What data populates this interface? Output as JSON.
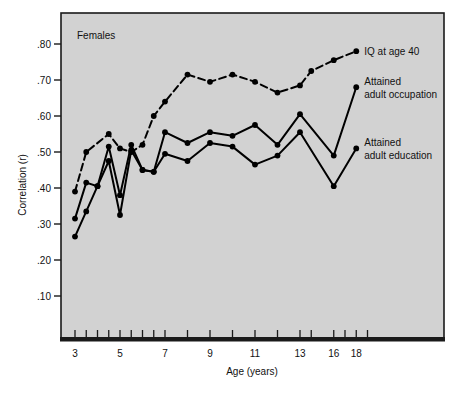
{
  "figure": {
    "panel_label": "Females",
    "background_color": "#d2d2d2",
    "frame_color": "#1a1a1a",
    "line_color": "#000000"
  },
  "chart_data": {
    "type": "line",
    "title": "Females",
    "xlabel": "Age (years)",
    "ylabel": "Correlation (r)",
    "xlim": [
      2.5,
      19.5
    ],
    "ylim": [
      0.0,
      0.86
    ],
    "grid": false,
    "legend_position": "right-inline-labels",
    "x_tick_labels": [
      "3",
      "5",
      "7",
      "9",
      "11",
      "13",
      "16",
      "18"
    ],
    "x_tick_values": [
      3,
      5,
      7,
      9,
      11,
      13,
      16,
      18
    ],
    "x_minor_tick_values": [
      3.5,
      4,
      4.5,
      5.5,
      6,
      6.5,
      8,
      10,
      12,
      14,
      17,
      19
    ],
    "y_tick_labels": [
      ".80",
      ".70",
      ".60",
      ".50",
      ".40",
      ".30",
      ".20",
      ".10"
    ],
    "y_tick_values": [
      0.8,
      0.7,
      0.6,
      0.5,
      0.4,
      0.3,
      0.2,
      0.1
    ],
    "series": [
      {
        "name": "IQ at age 40",
        "label": "IQ at age 40",
        "style": "dashed",
        "x": [
          3,
          3.5,
          4.5,
          5,
          5.5,
          6,
          6.5,
          7,
          8,
          9,
          10,
          11,
          12,
          13,
          14,
          16,
          18
        ],
        "values": [
          0.39,
          0.5,
          0.55,
          0.51,
          0.5,
          0.52,
          0.6,
          0.64,
          0.715,
          0.695,
          0.715,
          0.695,
          0.665,
          0.685,
          0.725,
          0.755,
          0.78
        ]
      },
      {
        "name": "Attained adult occupation",
        "label": "Attained adult occupation",
        "style": "solid",
        "x": [
          3,
          3.5,
          4,
          4.5,
          5,
          5.5,
          6,
          6.5,
          7,
          8,
          9,
          10,
          11,
          12,
          13,
          16,
          18
        ],
        "values": [
          0.315,
          0.415,
          0.405,
          0.515,
          0.38,
          0.52,
          0.45,
          0.445,
          0.555,
          0.525,
          0.555,
          0.545,
          0.575,
          0.52,
          0.605,
          0.49,
          0.68
        ]
      },
      {
        "name": "Attained adult education",
        "label": "Attained adult education",
        "style": "solid",
        "x": [
          3,
          3.5,
          4,
          4.5,
          5,
          5.5,
          6,
          6.5,
          7,
          8,
          9,
          10,
          11,
          12,
          13,
          16,
          18
        ],
        "values": [
          0.265,
          0.335,
          0.405,
          0.475,
          0.325,
          0.505,
          0.45,
          0.445,
          0.495,
          0.475,
          0.525,
          0.515,
          0.465,
          0.49,
          0.555,
          0.405,
          0.51
        ]
      }
    ]
  },
  "annotations": {
    "series_labels": [
      {
        "text": "IQ at age 40",
        "x": 18,
        "y": 0.78
      },
      {
        "text_line1": "Attained",
        "text_line2": "adult occupation",
        "x": 18,
        "y": 0.68
      },
      {
        "text_line1": "Attained",
        "text_line2": "adult education",
        "x": 18,
        "y": 0.51
      }
    ]
  }
}
